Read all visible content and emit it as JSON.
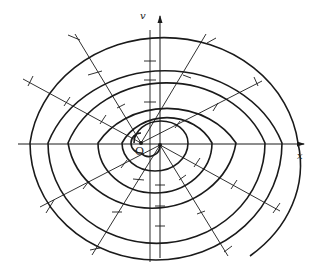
{
  "diagram": {
    "type": "two-center spiral construction with radial lines",
    "labels": {
      "x_axis": "x",
      "v_axis": "v",
      "origin": "O"
    },
    "colors": {
      "stroke": "#1a1a1a",
      "background": "#ffffff"
    },
    "centers": [
      {
        "name": "O",
        "x": 141,
        "y": 143
      },
      {
        "name": "second-center",
        "x": 160,
        "y": 145
      }
    ],
    "spiral_turns": 5,
    "radial_lines": 8
  }
}
